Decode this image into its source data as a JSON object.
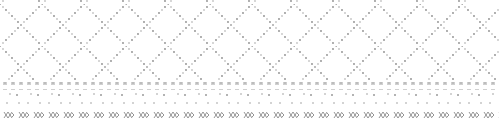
{
  "pattern": {
    "kind": "decorative cross-stitch textile pattern",
    "colors": {
      "background": "#ffffff",
      "dot_dark": "#8c8c8c",
      "dot_light": "#c4c4c4",
      "band_square": "#c8c8c8",
      "motif": "#777777"
    },
    "bands": [
      {
        "name": "diamond-dot-lattice",
        "description": "diagonal lattice of grey dots"
      },
      {
        "name": "square-row",
        "description": "row of small light squares"
      },
      {
        "name": "lower-dot-lattice",
        "description": "sparse dot lattice"
      },
      {
        "name": "cross-stitch-motif-row",
        "description": "repeating XX cross motifs"
      }
    ]
  }
}
